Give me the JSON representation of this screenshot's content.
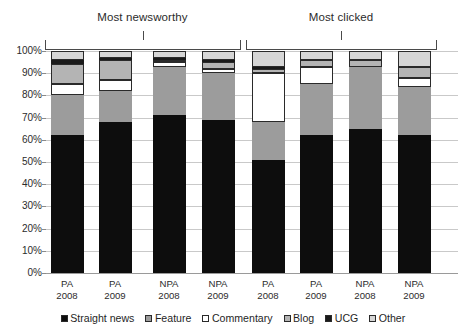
{
  "chart_data": {
    "type": "bar",
    "title": "",
    "subtitle": "",
    "stacked": true,
    "stack_total": 100,
    "xlabel": "",
    "ylabel": "",
    "ylim": [
      0,
      100
    ],
    "ytick_labels": [
      "100%",
      "90%",
      "80%",
      "70%",
      "60%",
      "50%",
      "40%",
      "30%",
      "20%",
      "10%",
      "0%"
    ],
    "ytick_values": [
      100,
      90,
      80,
      70,
      60,
      50,
      40,
      30,
      20,
      10,
      0
    ],
    "grid": true,
    "legend_position": "bottom",
    "groups": [
      {
        "label": "Most newsworthy",
        "bars": [
          0,
          1,
          2,
          3
        ]
      },
      {
        "label": "Most clicked",
        "bars": [
          4,
          5,
          6,
          7
        ]
      }
    ],
    "categories": [
      "PA\n2008",
      "PA\n2009",
      "NPA\n2008",
      "NPA\n2009",
      "PA\n2008",
      "PA\n2009",
      "NPA\n2008",
      "NPA\n2009"
    ],
    "category_lines": [
      [
        "PA",
        "2008"
      ],
      [
        "PA",
        "2009"
      ],
      [
        "NPA",
        "2008"
      ],
      [
        "NPA",
        "2009"
      ],
      [
        "PA",
        "2008"
      ],
      [
        "PA",
        "2009"
      ],
      [
        "NPA",
        "2008"
      ],
      [
        "NPA",
        "2009"
      ]
    ],
    "series": [
      {
        "name": "Straight news",
        "color": "#0d0d0d",
        "outlined": false,
        "values": [
          62,
          68,
          71,
          69,
          51,
          62,
          65,
          62
        ]
      },
      {
        "name": "Feature",
        "color": "#9c9c9c",
        "outlined": false,
        "values": [
          18,
          14,
          22,
          21,
          17,
          23,
          28,
          22
        ]
      },
      {
        "name": "Commentary",
        "color": "#ffffff",
        "outlined": true,
        "values": [
          5,
          5,
          2,
          2,
          22,
          8,
          0,
          4
        ]
      },
      {
        "name": "Blog",
        "color": "#b4b4b4",
        "outlined": true,
        "values": [
          9,
          9,
          1,
          3,
          2,
          3,
          3,
          5
        ]
      },
      {
        "name": "UCG",
        "color": "#1a1a1a",
        "outlined": false,
        "values": [
          2,
          1,
          1,
          1,
          1,
          0,
          0,
          0
        ]
      },
      {
        "name": "Other",
        "color": "#d6d6d6",
        "outlined": true,
        "values": [
          4,
          3,
          3,
          4,
          7,
          4,
          4,
          7
        ]
      }
    ]
  },
  "legend": {
    "items": [
      {
        "label": "Straight news"
      },
      {
        "label": "Feature"
      },
      {
        "label": "Commentary"
      },
      {
        "label": "Blog"
      },
      {
        "label": "UCG"
      },
      {
        "label": "Other"
      }
    ]
  }
}
